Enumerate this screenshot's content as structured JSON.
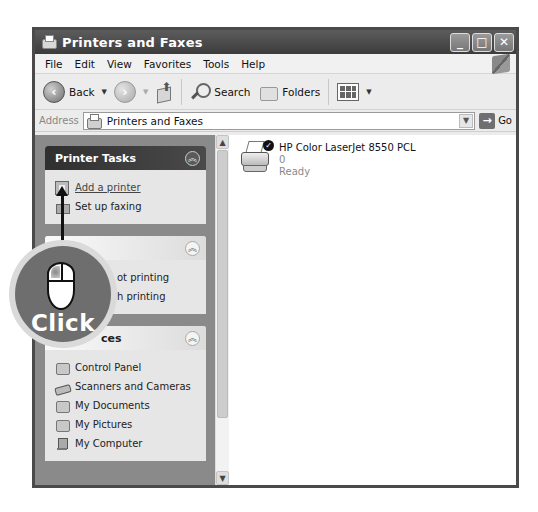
{
  "window": {
    "title": "Printers and Faxes",
    "controls": [
      "_",
      "□",
      "✕"
    ]
  },
  "menubar": {
    "items": [
      "File",
      "Edit",
      "View",
      "Favorites",
      "Tools",
      "Help"
    ]
  },
  "toolbar": {
    "back_label": "Back",
    "search_label": "Search",
    "folders_label": "Folders"
  },
  "addressbar": {
    "label": "Address",
    "value": "Printers and Faxes",
    "go_label": "Go"
  },
  "sidebar": {
    "panels": [
      {
        "title": "Printer Tasks",
        "style": "dark",
        "items": [
          {
            "label": "Add a printer",
            "icon": "add-printer-icon",
            "link": true
          },
          {
            "label": "Set up faxing",
            "icon": "fax-icon",
            "link": false
          }
        ]
      },
      {
        "title": "",
        "style": "light",
        "items": [
          {
            "label": "ot printing",
            "icon": "help-icon"
          },
          {
            "label": "h printing",
            "icon": "help-icon"
          }
        ]
      },
      {
        "title": "ces",
        "style": "light",
        "items": [
          {
            "label": "Control Panel",
            "icon": "control-panel-icon"
          },
          {
            "label": "Scanners and Cameras",
            "icon": "scanner-icon"
          },
          {
            "label": "My Documents",
            "icon": "documents-icon"
          },
          {
            "label": "My Pictures",
            "icon": "pictures-icon"
          },
          {
            "label": "My Computer",
            "icon": "computer-icon"
          }
        ]
      }
    ]
  },
  "content": {
    "printers": [
      {
        "name": "HP Color LaserJet 8550 PCL",
        "documents": "0",
        "status": "Ready",
        "default": true
      }
    ]
  },
  "callout": {
    "label": "Click"
  }
}
